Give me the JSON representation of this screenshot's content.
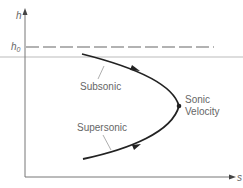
{
  "diagram": {
    "type": "h-s diagram",
    "axes": {
      "y_label": "h",
      "x_label": "s"
    },
    "reference_line": {
      "label": "h",
      "subscript": "0",
      "style": "dashed"
    },
    "curve_labels": {
      "upper": "Subsonic",
      "lower": "Supersonic",
      "tip_line1": "Sonic",
      "tip_line2": "Velocity"
    },
    "colors": {
      "curve": "#222222",
      "axis": "#777777",
      "dashed": "#666666",
      "guide": "#bbbbbb",
      "text": "#666666"
    }
  }
}
